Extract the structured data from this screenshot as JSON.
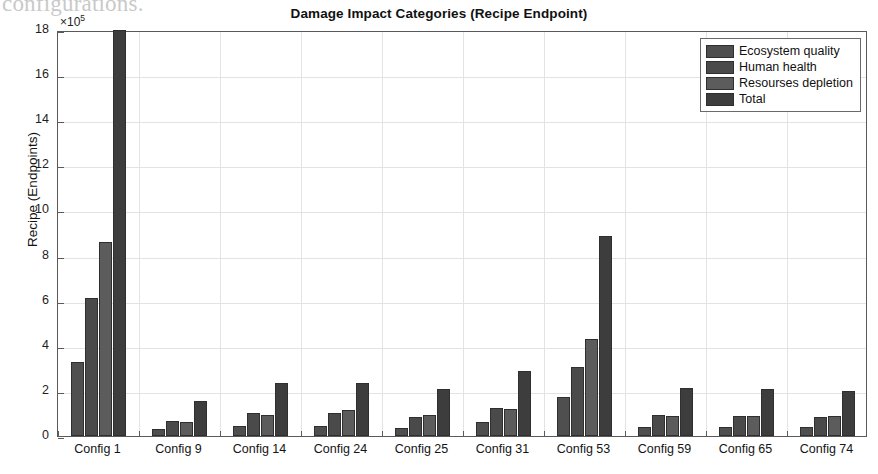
{
  "page": {
    "scanned_text_top": "configurations.",
    "scanned_text_ghost": ""
  },
  "chart_data": {
    "type": "bar",
    "title": "Damage Impact Categories (Recipe Endpoint)",
    "xlabel": "",
    "ylabel": "Recipe (Endpoints)",
    "y_exponent_label": "×10⁵",
    "y_exponent_base": "×10",
    "y_exponent_power": "5",
    "ylim": [
      0,
      18
    ],
    "ytick_labels": [
      "0",
      "2",
      "4",
      "6",
      "8",
      "10",
      "12",
      "14",
      "16",
      "18"
    ],
    "ytick_values": [
      0,
      2,
      4,
      6,
      8,
      10,
      12,
      14,
      16,
      18
    ],
    "grid": true,
    "legend_position": "top-right",
    "categories": [
      "Config 1",
      "Config 9",
      "Config 14",
      "Config 24",
      "Config 25",
      "Config 31",
      "Config 53",
      "Config 59",
      "Config 65",
      "Config 74"
    ],
    "series": [
      {
        "name": "Ecosystem quality",
        "color": "#4f4f4f",
        "values": [
          3.3,
          0.3,
          0.45,
          0.45,
          0.35,
          0.6,
          1.75,
          0.42,
          0.42,
          0.38
        ]
      },
      {
        "name": "Human health",
        "color": "#4a4a4a",
        "values": [
          6.1,
          0.65,
          1.0,
          1.0,
          0.85,
          1.25,
          3.05,
          0.92,
          0.9,
          0.85
        ]
      },
      {
        "name": "Resourses depletion",
        "color": "#5c5c5c",
        "values": [
          8.6,
          0.6,
          0.95,
          1.15,
          0.95,
          1.2,
          4.3,
          0.88,
          0.9,
          0.88
        ]
      },
      {
        "name": "Total",
        "color": "#3d3d3d",
        "values": [
          18.0,
          1.55,
          2.35,
          2.35,
          2.1,
          2.9,
          8.85,
          2.15,
          2.1,
          2.0
        ]
      }
    ]
  }
}
